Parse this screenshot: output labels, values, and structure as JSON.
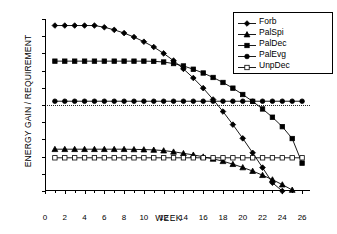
{
  "chart_data": {
    "type": "line",
    "title": "",
    "xlabel": "WEEK",
    "ylabel": "ENERGY GAIN / REQUIREMENT",
    "xlim": [
      0,
      26.8
    ],
    "ylim": [
      0.5,
      1.5
    ],
    "xticks": [
      0,
      2,
      4,
      6,
      8,
      10,
      12,
      14,
      16,
      18,
      20,
      22,
      24,
      26
    ],
    "yticks": [
      0.5,
      0.6,
      0.7,
      0.8,
      0.9,
      1.0,
      1.1,
      1.2,
      1.3,
      1.4,
      1.5
    ],
    "ytick_labels": [
      "0.5",
      "0.6",
      "0.7",
      "0.8",
      "0.9",
      "1",
      "1.1",
      "1.2",
      "1.3",
      "1.4",
      "1.5"
    ],
    "xtick_labels": [
      "0",
      "2",
      "4",
      "6",
      "8",
      "10",
      "12",
      "14",
      "16",
      "18",
      "20",
      "22",
      "24",
      "26"
    ],
    "grid": false,
    "legend_position": "top-right",
    "reference_line": {
      "y": 1.0,
      "style": "dotted",
      "color": "#000000"
    },
    "x": [
      1,
      2,
      3,
      4,
      5,
      6,
      7,
      8,
      9,
      10,
      11,
      12,
      13,
      14,
      15,
      16,
      17,
      18,
      19,
      20,
      21,
      22,
      23,
      24,
      25,
      26
    ],
    "series": [
      {
        "name": "Forb",
        "marker": "diamond",
        "color": "#000000",
        "filled": true,
        "values": [
          1.462,
          1.462,
          1.462,
          1.462,
          1.462,
          1.452,
          1.437,
          1.418,
          1.395,
          1.368,
          1.337,
          1.3,
          1.258,
          1.21,
          1.157,
          1.098,
          1.032,
          0.962,
          0.886,
          0.806,
          0.722,
          0.636,
          0.548,
          0.5,
          null,
          null
        ]
      },
      {
        "name": "PalSpi",
        "marker": "triangle",
        "color": "#000000",
        "filled": true,
        "values": [
          0.743,
          0.743,
          0.743,
          0.743,
          0.743,
          0.743,
          0.743,
          0.743,
          0.742,
          0.741,
          0.739,
          0.735,
          0.728,
          0.719,
          0.71,
          0.699,
          0.687,
          0.673,
          0.656,
          0.637,
          0.616,
          0.592,
          0.566,
          0.537,
          0.506,
          null
        ]
      },
      {
        "name": "PalDec",
        "marker": "square",
        "color": "#000000",
        "filled": true,
        "values": [
          1.255,
          1.255,
          1.255,
          1.255,
          1.255,
          1.255,
          1.255,
          1.255,
          1.255,
          1.255,
          1.254,
          1.25,
          1.241,
          1.227,
          1.208,
          1.186,
          1.16,
          1.131,
          1.098,
          1.061,
          1.021,
          0.977,
          0.929,
          0.874,
          0.805,
          0.662
        ]
      },
      {
        "name": "PalEvg",
        "marker": "circle",
        "color": "#000000",
        "filled": true,
        "values": [
          1.022,
          1.022,
          1.022,
          1.022,
          1.022,
          1.022,
          1.022,
          1.022,
          1.022,
          1.022,
          1.022,
          1.022,
          1.022,
          1.022,
          1.022,
          1.022,
          1.022,
          1.022,
          1.022,
          1.022,
          1.022,
          1.022,
          1.022,
          1.022,
          1.022,
          1.022
        ]
      },
      {
        "name": "UnpDec",
        "marker": "square",
        "color": "#000000",
        "filled": false,
        "values": [
          0.693,
          0.693,
          0.693,
          0.693,
          0.693,
          0.693,
          0.693,
          0.693,
          0.693,
          0.693,
          0.693,
          0.693,
          0.693,
          0.693,
          0.693,
          0.693,
          0.693,
          0.693,
          0.693,
          0.693,
          0.693,
          0.693,
          0.693,
          0.693,
          0.693,
          0.693
        ]
      }
    ]
  }
}
